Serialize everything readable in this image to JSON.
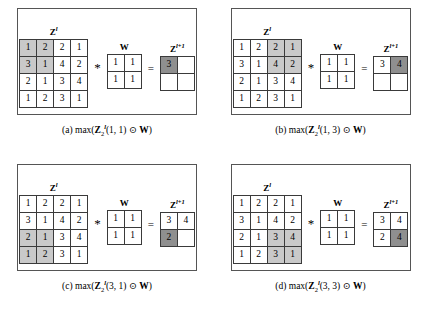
{
  "figure": {
    "matrix_labels": {
      "input": "Z",
      "input_sup": "l",
      "kernel": "W",
      "output": "Z",
      "output_sup": "l+1"
    },
    "operators": {
      "convolve": "*",
      "equals": "=",
      "hadamard": "⊙"
    },
    "input_matrix": [
      [
        1,
        2,
        2,
        1
      ],
      [
        3,
        1,
        4,
        2
      ],
      [
        2,
        1,
        3,
        4
      ],
      [
        1,
        2,
        3,
        1
      ]
    ],
    "kernel_matrix": [
      [
        1,
        1
      ],
      [
        1,
        1
      ]
    ],
    "panels": [
      {
        "id": "a",
        "caption_prefix": "(a) max(",
        "caption_index": "(1, 1)",
        "caption_suffix": ")",
        "window_rows": [
          0,
          1
        ],
        "window_cols": [
          0,
          1
        ],
        "output_matrix": [
          [
            "3",
            ""
          ],
          [
            "",
            ""
          ]
        ],
        "output_highlight": [
          0,
          0
        ]
      },
      {
        "id": "b",
        "caption_prefix": "(b) max(",
        "caption_index": "(1, 3)",
        "caption_suffix": ")",
        "window_rows": [
          0,
          1
        ],
        "window_cols": [
          2,
          3
        ],
        "output_matrix": [
          [
            "3",
            "4"
          ],
          [
            "",
            ""
          ]
        ],
        "output_highlight": [
          0,
          1
        ]
      },
      {
        "id": "c",
        "caption_prefix": "(c) max(",
        "caption_index": "(3, 1)",
        "caption_suffix": ")",
        "window_rows": [
          2,
          3
        ],
        "window_cols": [
          0,
          1
        ],
        "output_matrix": [
          [
            "3",
            "4"
          ],
          [
            "2",
            ""
          ]
        ],
        "output_highlight": [
          1,
          0
        ]
      },
      {
        "id": "d",
        "caption_prefix": "(d) max(",
        "caption_index": "(3, 3)",
        "caption_suffix": ")",
        "window_rows": [
          2,
          3
        ],
        "window_cols": [
          2,
          3
        ],
        "output_matrix": [
          [
            "3",
            "4"
          ],
          [
            "2",
            "4"
          ]
        ],
        "output_highlight": [
          1,
          1
        ]
      }
    ]
  }
}
